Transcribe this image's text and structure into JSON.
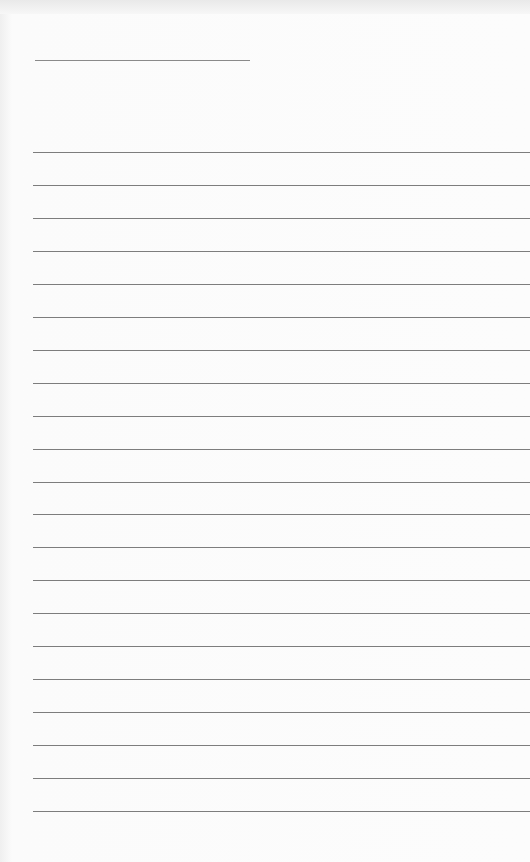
{
  "document": {
    "type": "blank lined sheet",
    "title_line": {
      "top": 60,
      "left": 35,
      "width": 215
    },
    "rules": {
      "count": 21,
      "first_top": 152,
      "spacing": 32.95,
      "left": 33
    },
    "colors": {
      "paper": "#fcfcfc",
      "line": "#7d7d7d"
    }
  }
}
